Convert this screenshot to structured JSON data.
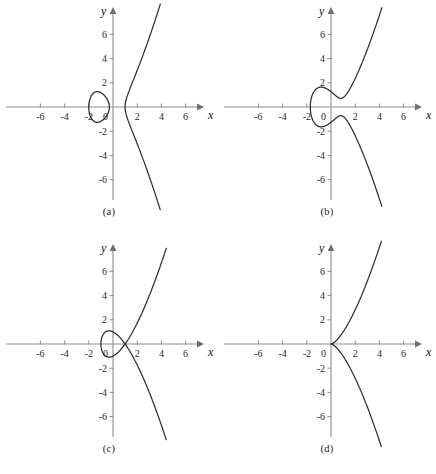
{
  "figure": {
    "background": "#ffffff",
    "curve_color": "#2b2b2b",
    "axis_color": "#8d8d8d",
    "panel_count": 4
  },
  "axes": {
    "xlabel": "x",
    "ylabel": "y",
    "origin_label": "0",
    "xticks": [
      -6,
      -4,
      -2,
      2,
      4,
      6
    ],
    "yticks": [
      6,
      4,
      2,
      -2,
      -4,
      -6
    ],
    "xtick_labels": [
      "-6",
      "-4",
      "-2",
      "2",
      "4",
      "6"
    ],
    "ytick_labels": [
      "6",
      "4",
      "2",
      "-2",
      "-4",
      "-6"
    ],
    "xlim": [
      -7.6,
      7.6
    ],
    "ylim": [
      -7.6,
      7.6
    ],
    "grid": false
  },
  "chart_data": {
    "type": "line",
    "title": "",
    "xlabel": "x",
    "ylabel": "y",
    "xlim": [
      -7.6,
      7.6
    ],
    "ylim": [
      -7.6,
      7.6
    ],
    "grid": false,
    "legend": "none",
    "panels": [
      {
        "caption": "(a)",
        "equation": "y^2 = (x + 2)(x + 0.3)(x - 1)",
        "topology": "two components: closed oval and unbounded branch",
        "roots": [
          -2,
          -0.3,
          1
        ],
        "oval_x_range": [
          -2,
          -0.3
        ],
        "branch_x_start": 1,
        "oval_y_max": 1.35,
        "branch_exits_top_at_x": 3.8,
        "branch_exits_bottom_at_x": 3.8
      },
      {
        "caption": "(b)",
        "equation": "y^2 = x^3 - 2x + 1.6",
        "topology": "single connected component, smooth, with inflection",
        "roots": [
          -1.6
        ],
        "oval_x_range": [],
        "branch_x_start": -1.6,
        "local_min_point": [
          0.82,
          0.8
        ],
        "branch_exits_top_at_x": 3.75,
        "branch_exits_bottom_at_x": 3.75
      },
      {
        "caption": "(c)",
        "equation": "y^2 = (x + 1)(x - 1)^2",
        "topology": "nodal cubic: oval meets branch at node",
        "roots": [
          -1,
          1,
          1
        ],
        "node_point": [
          1,
          0
        ],
        "oval_x_range": [
          -1,
          1
        ],
        "oval_y_max": 1.1,
        "branch_exits_top_at_x": 4.0,
        "branch_exits_bottom_at_x": 4.0
      },
      {
        "caption": "(d)",
        "equation": "y^2 = x^3",
        "topology": "cuspidal cubic: cusp at origin",
        "roots": [
          0
        ],
        "cusp_point": [
          0,
          0
        ],
        "oval_x_range": [],
        "branch_x_start": 0,
        "branch_exits_top_at_x": 3.66,
        "branch_exits_bottom_at_x": 3.66
      }
    ]
  }
}
